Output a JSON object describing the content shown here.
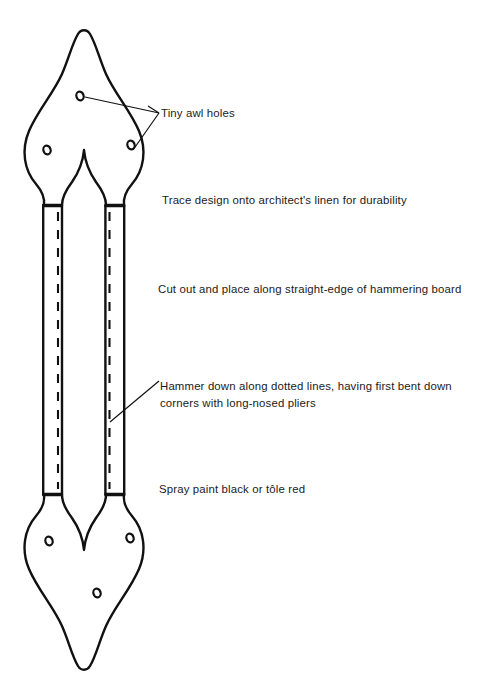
{
  "page": {
    "width": 486,
    "height": 687,
    "background": "#ffffff",
    "ink_color": "#111111"
  },
  "figure": {
    "name": "sconce-backplate-template",
    "stroke_color": "#111111",
    "awl_holes": [
      {
        "id": "upper-center",
        "cx": 80,
        "cy": 96
      },
      {
        "id": "upper-left",
        "cx": 47,
        "cy": 150
      },
      {
        "id": "upper-right",
        "cx": 131,
        "cy": 145
      },
      {
        "id": "lower-left",
        "cx": 49,
        "cy": 541
      },
      {
        "id": "lower-right",
        "cx": 130,
        "cy": 538
      },
      {
        "id": "lower-center",
        "cx": 97,
        "cy": 593
      }
    ],
    "strips": [
      {
        "id": "left-strip",
        "x1": 43,
        "x2": 62,
        "top": 205,
        "bottom": 495,
        "fold_line_x": 58
      },
      {
        "id": "right-strip",
        "x1": 105,
        "x2": 124,
        "top": 205,
        "bottom": 495,
        "fold_line_x": 109
      }
    ]
  },
  "annotations": {
    "awl_holes_label": "Tiny awl holes",
    "trace_note": "Trace design onto architect's linen for durability",
    "cut_note": "Cut out and place along straight-edge of hammering board",
    "hammer_note": "Hammer down along dotted lines, having first bent down corners with long-nosed pliers",
    "spray_note": "Spray paint black or tôle red"
  }
}
